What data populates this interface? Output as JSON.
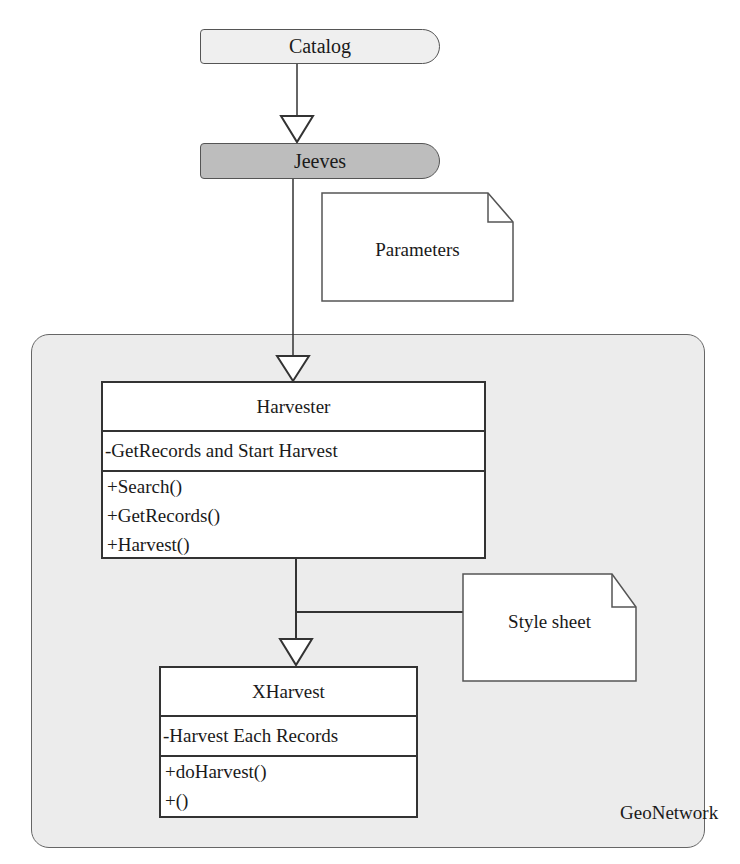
{
  "diagram": {
    "type": "uml-class-diagram",
    "nodes": {
      "catalog": {
        "label": "Catalog",
        "fill": "#efefef"
      },
      "jeeves": {
        "label": "Jeeves",
        "fill": "#bdbdbd"
      },
      "parameters_note": {
        "label": "Parameters"
      },
      "stylesheet_note": {
        "label": "Style sheet"
      },
      "package": {
        "label": "GeoNetwork",
        "fill": "#ececec"
      },
      "harvester": {
        "name": "Harvester",
        "attributes": [
          "-GetRecords and Start Harvest"
        ],
        "operations": [
          "+Search()",
          "+GetRecords()",
          "+Harvest()"
        ]
      },
      "xharvest": {
        "name": "XHarvest",
        "attributes": [
          "-Harvest Each Records"
        ],
        "operations": [
          "+doHarvest()",
          "+()"
        ]
      }
    },
    "edges": [
      {
        "from": "Catalog",
        "to": "Jeeves",
        "type": "generalization"
      },
      {
        "from": "Jeeves",
        "to": "Harvester",
        "type": "generalization"
      },
      {
        "from": "Harvester",
        "to": "XHarvest",
        "type": "generalization"
      },
      {
        "from": "Style sheet",
        "to": "Harvester-XHarvest link",
        "type": "association"
      }
    ]
  }
}
